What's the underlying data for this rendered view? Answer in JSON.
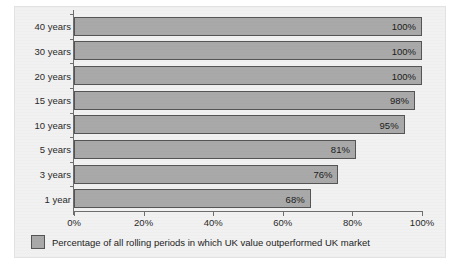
{
  "chart_data": {
    "type": "bar",
    "orientation": "horizontal",
    "title": "",
    "xlabel": "",
    "ylabel": "",
    "xlim": [
      0,
      100
    ],
    "grid": false,
    "legend_position": "bottom-left",
    "categories": [
      "40 years",
      "30 years",
      "20 years",
      "15 years",
      "10 years",
      "5 years",
      "3 years",
      "1 year"
    ],
    "values": [
      100,
      100,
      100,
      98,
      95,
      81,
      76,
      68
    ],
    "value_labels": [
      "100%",
      "100%",
      "100%",
      "98%",
      "95%",
      "81%",
      "76%",
      "68%"
    ],
    "xticks": [
      0,
      20,
      40,
      60,
      80,
      100
    ],
    "xtick_labels": [
      "0%",
      "20%",
      "40%",
      "60%",
      "80%",
      "100%"
    ],
    "legend": [
      "Percentage of all rolling periods in which UK value outperformed UK market"
    ],
    "series": [
      {
        "name": "Percentage of all rolling periods in which UK value outperformed UK market",
        "values": [
          100,
          100,
          100,
          98,
          95,
          81,
          76,
          68
        ]
      }
    ]
  },
  "legend": {
    "label": "Percentage of all rolling periods in which UK value outperformed UK market"
  },
  "colors": {
    "bar_fill": "#a9a9a9",
    "bar_border": "#555555",
    "panel_background": "#f1f1f1",
    "axis": "#6e6e6e",
    "text": "#1c1c1c"
  },
  "caption": ""
}
